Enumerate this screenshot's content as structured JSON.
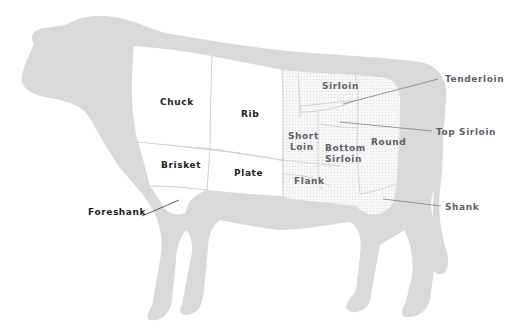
{
  "colors": {
    "silhouette": "#d9d9d9",
    "primal_white": "#ffffff",
    "hindquarter_dotted": "#f2f2f2",
    "label_dark": "#1e1f28",
    "label_gray": "#5e606c",
    "leader_line": "#7a7d88"
  },
  "cuts": {
    "chuck": "Chuck",
    "rib": "Rib",
    "brisket": "Brisket",
    "plate": "Plate",
    "foreshank": "Foreshank",
    "sirloin": "Sirloin",
    "short_loin_1": "Short",
    "short_loin_2": "Loin",
    "bottom_sirloin_1": "Bottom",
    "bottom_sirloin_2": "Sirloin",
    "round": "Round",
    "flank": "Flank",
    "tenderloin": "Tenderloin",
    "top_sirloin": "Top Sirloin",
    "shank": "Shank"
  }
}
